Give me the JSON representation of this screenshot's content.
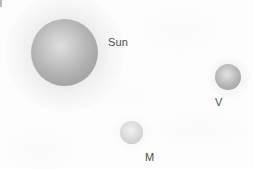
{
  "figure": {
    "background_color": "#fdfdfd",
    "width": 253,
    "height": 169
  },
  "bodies": [
    {
      "id": "sun",
      "label": "Sun",
      "icon": "sphere-icon",
      "center_x": 65,
      "center_y": 52,
      "diameter_px": 67,
      "fill_center_color": "#dedede",
      "fill_edge_color": "#9a9a9a",
      "has_glow": true,
      "label_x": 108,
      "label_y": 36
    },
    {
      "id": "venus",
      "label": "V",
      "icon": "sphere-icon",
      "center_x": 228,
      "center_y": 77,
      "diameter_px": 26,
      "fill_center_color": "#e2e2e2",
      "fill_edge_color": "#a2a2a2",
      "has_glow": true,
      "label_x": 215,
      "label_y": 96
    },
    {
      "id": "mercury",
      "label": "M",
      "icon": "sphere-icon",
      "center_x": 131,
      "center_y": 132,
      "diameter_px": 23,
      "fill_center_color": "#f0f0f0",
      "fill_edge_color": "#cacaca",
      "has_glow": true,
      "label_x": 145,
      "label_y": 151
    }
  ],
  "labels": {
    "sun": "Sun",
    "venus": "V",
    "mercury": "M"
  },
  "colors": {
    "label_text": "#4d4d4d",
    "background": "#fdfdfd",
    "sun_fill": "#b6b6b6",
    "venus_fill": "#b5b5b5",
    "mercury_fill": "#d8d8d8"
  }
}
